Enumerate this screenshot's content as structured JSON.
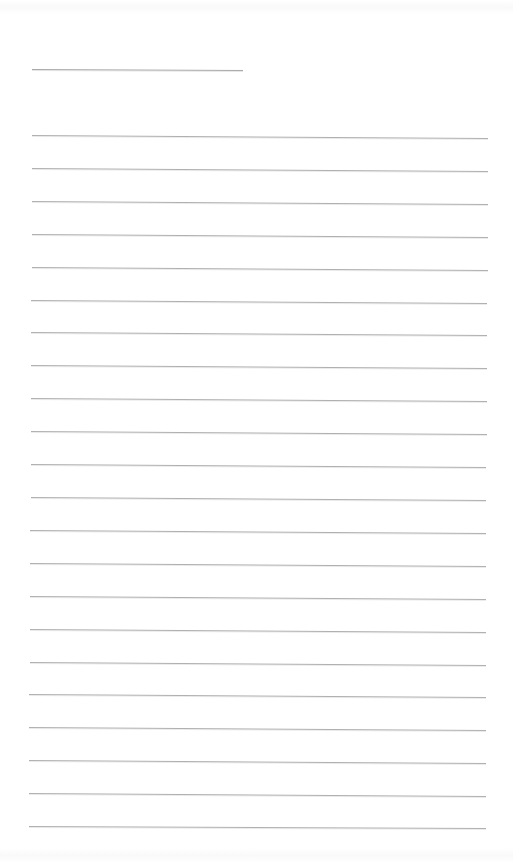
{
  "page": {
    "background": "#ffffff",
    "line_color": "#b0b0b0",
    "title_line": {
      "x1": 32,
      "y1": 69,
      "x2": 243,
      "y2": 70,
      "label": ""
    },
    "rules": [
      {
        "y": 135,
        "x1": 32,
        "x2": 488,
        "drop": 3
      },
      {
        "y": 168,
        "x1": 32,
        "x2": 488,
        "drop": 3
      },
      {
        "y": 201,
        "x1": 32,
        "x2": 488,
        "drop": 3
      },
      {
        "y": 234,
        "x1": 32,
        "x2": 488,
        "drop": 3
      },
      {
        "y": 267,
        "x1": 32,
        "x2": 488,
        "drop": 3
      },
      {
        "y": 300,
        "x1": 31,
        "x2": 487,
        "drop": 3
      },
      {
        "y": 332,
        "x1": 31,
        "x2": 487,
        "drop": 3
      },
      {
        "y": 365,
        "x1": 31,
        "x2": 487,
        "drop": 3
      },
      {
        "y": 398,
        "x1": 31,
        "x2": 487,
        "drop": 3
      },
      {
        "y": 431,
        "x1": 31,
        "x2": 487,
        "drop": 3
      },
      {
        "y": 464,
        "x1": 31,
        "x2": 486,
        "drop": 3
      },
      {
        "y": 497,
        "x1": 31,
        "x2": 486,
        "drop": 3
      },
      {
        "y": 530,
        "x1": 30,
        "x2": 486,
        "drop": 3
      },
      {
        "y": 563,
        "x1": 30,
        "x2": 486,
        "drop": 3
      },
      {
        "y": 596,
        "x1": 30,
        "x2": 486,
        "drop": 3
      },
      {
        "y": 629,
        "x1": 30,
        "x2": 486,
        "drop": 3
      },
      {
        "y": 662,
        "x1": 30,
        "x2": 486,
        "drop": 3
      },
      {
        "y": 694,
        "x1": 29,
        "x2": 486,
        "drop": 3
      },
      {
        "y": 727,
        "x1": 29,
        "x2": 486,
        "drop": 3
      },
      {
        "y": 760,
        "x1": 29,
        "x2": 486,
        "drop": 3
      },
      {
        "y": 793,
        "x1": 29,
        "x2": 486,
        "drop": 3
      },
      {
        "y": 826,
        "x1": 29,
        "x2": 486,
        "drop": 2
      }
    ]
  }
}
